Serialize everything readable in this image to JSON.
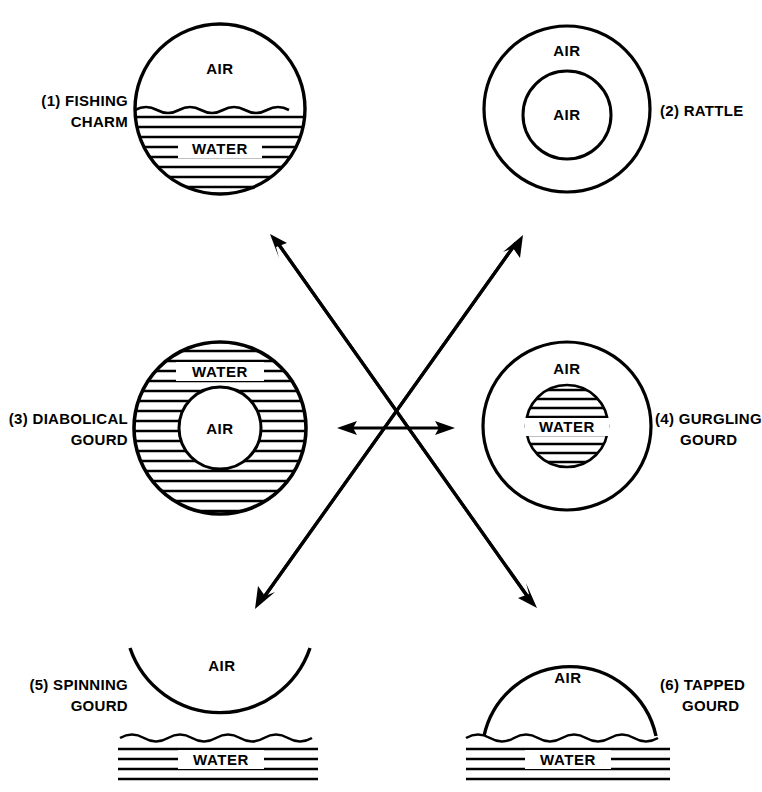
{
  "figure": {
    "background_color": "#ffffff",
    "ink_color": "#000000",
    "material_labels": {
      "air": "AIR",
      "water": "WATER"
    },
    "center_hub": {
      "description": "Crossing arrows hub",
      "arrows": [
        "up-left",
        "up-right",
        "down-left",
        "down-right",
        "left",
        "right"
      ]
    },
    "panels": [
      {
        "id": "fishing-charm",
        "number": "(1)",
        "callout_lines": [
          "(1) FISHING",
          "CHARM"
        ],
        "shape": "circle-half-filled",
        "contents": [
          "AIR",
          "WATER"
        ],
        "air_label": "AIR",
        "water_label": "WATER"
      },
      {
        "id": "rattle",
        "number": "(2)",
        "callout_lines": [
          "(2) RATTLE"
        ],
        "shape": "circle-in-circle",
        "contents": [
          "AIR",
          "AIR"
        ],
        "outer_label": "AIR",
        "inner_label": "AIR"
      },
      {
        "id": "diabolical-gourd",
        "number": "(3)",
        "callout_lines": [
          "(3) DIABOLICAL",
          "GOURD"
        ],
        "shape": "annulus-water-around-air",
        "contents": [
          "WATER",
          "AIR"
        ],
        "outer_label": "WATER",
        "inner_label": "AIR"
      },
      {
        "id": "gurgling-gourd",
        "number": "(4)",
        "callout_lines": [
          "(4) GURGLING",
          "GOURD"
        ],
        "shape": "annulus-air-around-water",
        "contents": [
          "AIR",
          "WATER"
        ],
        "outer_label": "AIR",
        "inner_label": "WATER"
      },
      {
        "id": "spinning-gourd",
        "number": "(5)",
        "callout_lines": [
          "(5) SPINNING",
          "GOURD"
        ],
        "shape": "inverted-dome-on-water",
        "contents": [
          "AIR",
          "WATER"
        ],
        "air_label": "AIR",
        "water_label": "WATER"
      },
      {
        "id": "tapped-gourd",
        "number": "(6)",
        "callout_lines": [
          "(6) TAPPED",
          "GOURD"
        ],
        "shape": "dome-on-water",
        "contents": [
          "AIR",
          "WATER"
        ],
        "air_label": "AIR",
        "water_label": "WATER"
      }
    ]
  }
}
